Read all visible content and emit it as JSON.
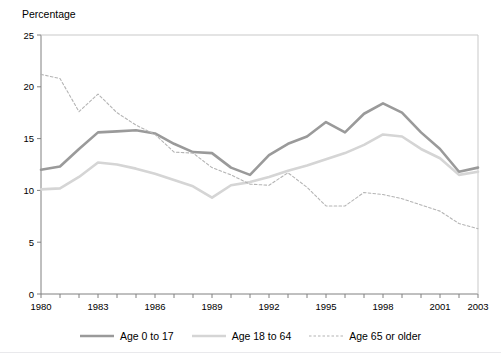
{
  "figure": {
    "clipped_header_text": "Percentage of people in poverty by age group, 1980 to 2003",
    "y_axis_title": "Percentage"
  },
  "legend": {
    "position": "bottom-center",
    "entries": [
      {
        "label": "Age 0 to 17",
        "style": "solid",
        "color": "#9a9a9a",
        "width": 2.6
      },
      {
        "label": "Age 18 to 64",
        "style": "solid",
        "color": "#d5d5d5",
        "width": 2.6
      },
      {
        "label": "Age 65 or older",
        "style": "dashed",
        "color": "#b4b4b4",
        "width": 1.1
      }
    ]
  },
  "chart_data": {
    "type": "line",
    "title": "",
    "xlabel": "",
    "ylabel": "Percentage",
    "xlim": [
      1980,
      2003
    ],
    "ylim": [
      0,
      25
    ],
    "grid": false,
    "y_ticks": [
      0,
      5,
      10,
      15,
      20,
      25
    ],
    "y_tick_labels": [
      "0",
      "5",
      "10",
      "15",
      "20",
      "25"
    ],
    "x_ticks": [
      1980,
      1981,
      1982,
      1983,
      1984,
      1985,
      1986,
      1987,
      1988,
      1989,
      1990,
      1991,
      1992,
      1993,
      1994,
      1995,
      1996,
      1997,
      1998,
      1999,
      2000,
      2001,
      2002,
      2003
    ],
    "x_tick_labels_shown": [
      "1980",
      "1983",
      "1986",
      "1989",
      "1992",
      "1995",
      "1998",
      "2001",
      "2003"
    ],
    "x": [
      1980,
      1981,
      1982,
      1983,
      1984,
      1985,
      1986,
      1987,
      1988,
      1989,
      1990,
      1991,
      1992,
      1993,
      1994,
      1995,
      1996,
      1997,
      1998,
      1999,
      2000,
      2001,
      2002,
      2003
    ],
    "series": [
      {
        "name": "Age 0 to 17",
        "color": "#9a9a9a",
        "style": "solid",
        "values": [
          12.0,
          12.3,
          14.0,
          15.6,
          15.7,
          15.8,
          15.5,
          14.5,
          13.7,
          13.6,
          12.2,
          11.5,
          13.4,
          14.5,
          15.2,
          16.6,
          15.6,
          17.4,
          18.4,
          17.5,
          15.6,
          14.0,
          11.8,
          12.2
        ],
        "label_first": "12.0",
        "label_peak": "18.4",
        "label_last": "12.2"
      },
      {
        "name": "Age 18 to 64",
        "color": "#d5d5d5",
        "style": "solid",
        "values": [
          10.1,
          10.2,
          11.3,
          12.7,
          12.5,
          12.1,
          11.6,
          11.0,
          10.4,
          9.3,
          10.5,
          10.8,
          11.3,
          11.9,
          12.4,
          13.0,
          13.6,
          14.4,
          15.4,
          15.2,
          14.0,
          13.1,
          11.5,
          11.8
        ],
        "label_first": "10.1",
        "label_peak": "15.4",
        "label_last": "11.8"
      },
      {
        "name": "Age 65 or older",
        "color": "#b4b4b4",
        "style": "dashed",
        "values": [
          21.2,
          20.8,
          17.6,
          19.3,
          17.5,
          16.3,
          15.4,
          13.7,
          13.6,
          12.2,
          11.5,
          10.6,
          10.5,
          11.7,
          10.3,
          8.5,
          8.5,
          9.8,
          9.6,
          9.2,
          8.6,
          8.0,
          6.8,
          6.3
        ],
        "label_first": "21.2",
        "label_peak": "21.2",
        "label_last": "6.3"
      }
    ]
  },
  "axes": {
    "y_label_0": "0",
    "y_label_5": "5",
    "y_label_10": "10",
    "y_label_15": "15",
    "y_label_20": "20",
    "y_label_25": "25",
    "x_label_1980": "1980",
    "x_label_1983": "1983",
    "x_label_1986": "1986",
    "x_label_1989": "1989",
    "x_label_1992": "1992",
    "x_label_1995": "1995",
    "x_label_1998": "1998",
    "x_label_2001": "2001",
    "x_label_2003": "2003"
  }
}
